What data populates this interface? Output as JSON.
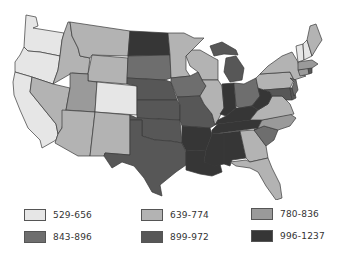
{
  "map": {
    "title": "",
    "region": "United States",
    "class_colors": {
      "c1": "#e6e6e6",
      "c2": "#b3b3b3",
      "c3": "#9a9a9a",
      "c4": "#6e6e6e",
      "c5": "#575757",
      "c6": "#363636"
    },
    "states": {
      "WA": "c1",
      "OR": "c1",
      "CA": "c1",
      "CO": "c1",
      "VT": "c1",
      "NH": "c1",
      "ID": "c2",
      "MT": "c2",
      "NV": "c2",
      "AZ": "c2",
      "NM": "c2",
      "WY": "c2",
      "MN": "c2",
      "WI": "c2",
      "IL": "c2",
      "ME": "c2",
      "NY": "c2",
      "PA": "c2",
      "VA": "c2",
      "FL": "c2",
      "GA": "c2",
      "UT": "c3",
      "MA": "c3",
      "CT": "c3",
      "NC": "c3",
      "SD": "c4",
      "IA": "c4",
      "OH": "c4",
      "SC": "c4",
      "NJ": "c4",
      "NE": "c5",
      "KS": "c5",
      "OK": "c5",
      "TX": "c5",
      "MO": "c5",
      "MI": "c5",
      "MD": "c5",
      "DE": "c5",
      "RI": "c5",
      "ND": "c6",
      "AR": "c6",
      "LA": "c6",
      "MS": "c6",
      "AL": "c6",
      "TN": "c6",
      "KY": "c6",
      "IN": "c6",
      "WV": "c6"
    }
  },
  "legend": {
    "items": [
      {
        "label": "529-656",
        "color": "#e6e6e6"
      },
      {
        "label": "639-774",
        "color": "#b3b3b3"
      },
      {
        "label": "780-836",
        "color": "#9a9a9a"
      },
      {
        "label": "843-896",
        "color": "#6e6e6e"
      },
      {
        "label": "899-972",
        "color": "#575757"
      },
      {
        "label": "996-1237",
        "color": "#363636"
      }
    ]
  }
}
